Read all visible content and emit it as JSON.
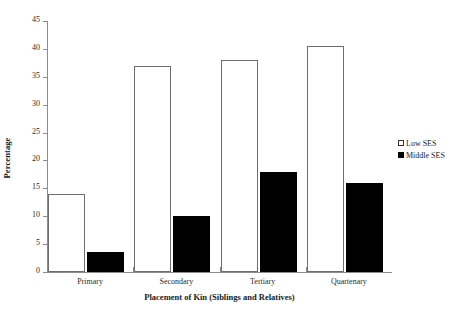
{
  "chart_data": {
    "type": "bar",
    "title": "",
    "xlabel": "Placement of Kin (Siblings and Relatives)",
    "ylabel": "Percentage",
    "categories": [
      "Primary",
      "Secondary",
      "Tertiary",
      "Quartenary"
    ],
    "series": [
      {
        "name": "Low SES",
        "color": "#ffffff",
        "values": [
          14,
          37,
          38,
          40.5
        ]
      },
      {
        "name": "Middle SES",
        "color": "#000000",
        "values": [
          3.5,
          10,
          18,
          16
        ]
      }
    ],
    "ylim": [
      0,
      45
    ],
    "ytick_step": 5,
    "yticks": [
      0,
      5,
      10,
      15,
      20,
      25,
      30,
      35,
      40,
      45
    ],
    "ytick_labels": [
      "0",
      "5",
      "10",
      "15",
      "20",
      "25",
      "30",
      "35",
      "40",
      "45"
    ],
    "grid": false,
    "legend_position": "right"
  },
  "legend": {
    "items": [
      {
        "label": "Low SES",
        "marker": "open-square-icon"
      },
      {
        "label": "Middle SES",
        "marker": "filled-square-icon"
      }
    ]
  }
}
